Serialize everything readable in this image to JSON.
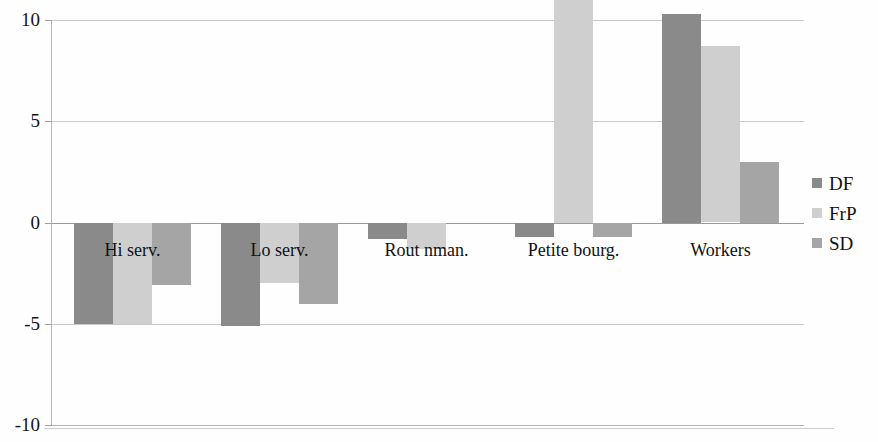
{
  "chart_data": {
    "type": "bar",
    "title": "",
    "subtitle": "",
    "xlabel": "",
    "ylabel": "",
    "ylim": [
      -10,
      10
    ],
    "yticks": [
      10,
      5,
      0,
      -5,
      -10
    ],
    "ytick_labels": [
      "10",
      "5",
      "0",
      "-5",
      "-10"
    ],
    "grid": true,
    "legend_position": "right",
    "orientation": "vertical",
    "categories": [
      "Hi serv.",
      "Lo serv.",
      "Rout nman.",
      "Petite bourg.",
      "Workers"
    ],
    "series": [
      {
        "name": "DF",
        "color": "#8a8a8a",
        "values": [
          -5.0,
          -5.1,
          -0.8,
          -0.7,
          10.3
        ]
      },
      {
        "name": "FrP",
        "color": "#cfcfcf",
        "values": [
          -5.0,
          -3.0,
          -1.3,
          11.0,
          8.7
        ]
      },
      {
        "name": "SD",
        "color": "#a5a5a5",
        "values": [
          -3.1,
          -4.0,
          0.0,
          -0.7,
          3.0
        ]
      }
    ]
  },
  "legend": {
    "items": [
      {
        "label": "DF",
        "color": "#8a8a8a"
      },
      {
        "label": "FrP",
        "color": "#cfcfcf"
      },
      {
        "label": "SD",
        "color": "#a5a5a5"
      }
    ]
  },
  "axis": {
    "y_ticks": [
      {
        "label": "10",
        "value": 10
      },
      {
        "label": "5",
        "value": 5
      },
      {
        "label": "0",
        "value": 0
      },
      {
        "label": "-5",
        "value": -5
      },
      {
        "label": "-10",
        "value": -10
      }
    ]
  },
  "colors": {
    "df": "#8a8a8a",
    "frp": "#cfcfcf",
    "sd": "#a5a5a5",
    "gridline": "#c9c9c9",
    "axis": "#b8b8b8",
    "text": "#111111",
    "background": "#ffffff"
  }
}
